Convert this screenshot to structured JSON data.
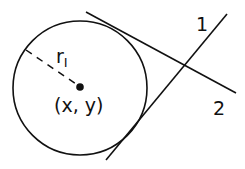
{
  "diagram": {
    "center_label": "(x, y)",
    "radius_label": "r",
    "radius_subscript": "I",
    "line_labels": [
      "1",
      "2"
    ],
    "stroke_color": "#111111",
    "background_color": "#ffffff"
  }
}
